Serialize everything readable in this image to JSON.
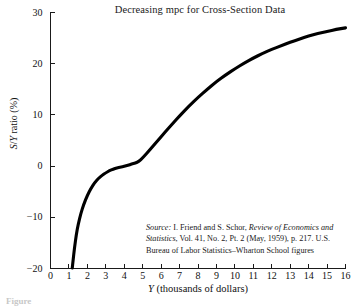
{
  "figure": {
    "caption_fragment": "Figure"
  },
  "chart_data": {
    "type": "line",
    "title": "Decreasing mpc for Cross-Section Data",
    "xlabel": "Y (thousands of dollars)",
    "xlabel_italic": "Y",
    "xlabel_rest": " (thousands of dollars)",
    "ylabel": "S/Y ratio (%)",
    "ylabel_parts": {
      "s": "S",
      "slash": "/",
      "y": "Y",
      "rest": " ratio (%)"
    },
    "xlim": [
      0,
      16
    ],
    "ylim": [
      -20,
      30
    ],
    "grid": false,
    "legend": null,
    "xticks": [
      0,
      1,
      2,
      3,
      4,
      5,
      6,
      7,
      8,
      9,
      10,
      11,
      12,
      13,
      14,
      15,
      16
    ],
    "yticks": [
      30,
      20,
      10,
      0,
      -10,
      -20
    ],
    "xtick_labels": [
      "0",
      "1",
      "2",
      "3",
      "4",
      "5",
      "6",
      "7",
      "8",
      "9",
      "10",
      "11",
      "12",
      "13",
      "14",
      "15",
      "16"
    ],
    "ytick_labels": [
      "30",
      "20",
      "10",
      "0",
      "−10",
      "−20"
    ],
    "series": [
      {
        "name": "S/Y ratio",
        "color": "#000000",
        "x": [
          1.18,
          1.22,
          1.3,
          1.4,
          1.5,
          1.65,
          1.8,
          2.0,
          2.2,
          2.4,
          2.6,
          2.8,
          3.0,
          3.2,
          3.4,
          3.6,
          3.8,
          4.0,
          4.2,
          4.4,
          4.6,
          4.8,
          5.0,
          5.4,
          5.8,
          6.2,
          6.6,
          7.0,
          7.5,
          8.0,
          8.5,
          9.0,
          9.5,
          10.0,
          10.5,
          11.0,
          11.5,
          12.0,
          12.5,
          13.0,
          13.5,
          14.0,
          14.5,
          15.0,
          15.5,
          16.0
        ],
        "y": [
          -19.9,
          -18.6,
          -16.0,
          -13.4,
          -11.4,
          -9.2,
          -7.5,
          -5.7,
          -4.3,
          -3.2,
          -2.4,
          -1.8,
          -1.3,
          -0.9,
          -0.6,
          -0.35,
          -0.2,
          -0.05,
          0.15,
          0.4,
          0.6,
          0.9,
          1.6,
          3.2,
          4.9,
          6.6,
          8.2,
          9.8,
          11.7,
          13.4,
          15.0,
          16.5,
          17.8,
          19.0,
          20.1,
          21.1,
          22.0,
          22.8,
          23.5,
          24.2,
          24.8,
          25.4,
          25.9,
          26.3,
          26.7,
          27.0
        ]
      }
    ],
    "annotations": {
      "source": {
        "label": "Source:",
        "line1_rest": " I. Friend and S. Schor, ",
        "line1_italic": "Review of Economics",
        "line2_italic": "and Statistics",
        "line2_rest": ", Vol. 41, No. 2, Pt. 2 (May, 1959), p. 217.",
        "line3": "U.S. Bureau of Labor Statistics–Wharton School figures"
      }
    }
  }
}
